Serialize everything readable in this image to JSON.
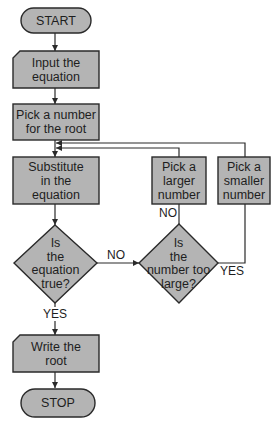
{
  "diagram": {
    "type": "flowchart",
    "nodes": [
      {
        "id": "start",
        "shape": "terminator",
        "label": "START"
      },
      {
        "id": "input",
        "shape": "manual-input",
        "label": "Input the\nequation"
      },
      {
        "id": "pick",
        "shape": "process",
        "label": "Pick a number\nfor the root"
      },
      {
        "id": "substitute",
        "shape": "process",
        "label": "Substitute\nin the\nequation"
      },
      {
        "id": "is_true",
        "shape": "decision",
        "label": "Is\nthe\nequation\ntrue?"
      },
      {
        "id": "too_large",
        "shape": "decision",
        "label": "Is\nthe\nnumber too\nlarge?"
      },
      {
        "id": "larger",
        "shape": "process",
        "label": "Pick a\nlarger\nnumber"
      },
      {
        "id": "smaller",
        "shape": "process",
        "label": "Pick a\nsmaller\nnumber"
      },
      {
        "id": "write",
        "shape": "manual-input",
        "label": "Write the\nroot"
      },
      {
        "id": "stop",
        "shape": "terminator",
        "label": "STOP"
      }
    ],
    "edges": [
      {
        "from": "start",
        "to": "input",
        "label": ""
      },
      {
        "from": "input",
        "to": "pick",
        "label": ""
      },
      {
        "from": "pick",
        "to": "substitute",
        "label": ""
      },
      {
        "from": "substitute",
        "to": "is_true",
        "label": ""
      },
      {
        "from": "is_true",
        "to": "too_large",
        "label": "NO"
      },
      {
        "from": "too_large",
        "to": "larger",
        "label": "NO"
      },
      {
        "from": "too_large",
        "to": "smaller",
        "label": "YES"
      },
      {
        "from": "larger",
        "to": "substitute",
        "label": ""
      },
      {
        "from": "smaller",
        "to": "substitute",
        "label": ""
      },
      {
        "from": "is_true",
        "to": "write",
        "label": "YES"
      },
      {
        "from": "write",
        "to": "stop",
        "label": ""
      }
    ],
    "edge_labels": {
      "is_true_no": "NO",
      "too_large_no": "NO",
      "too_large_yes": "YES",
      "is_true_yes": "YES"
    },
    "colors": {
      "fill": "#b4b4b4",
      "stroke": "#2a2a2a",
      "text": "#1e1e1e",
      "background": "#ffffff"
    }
  }
}
